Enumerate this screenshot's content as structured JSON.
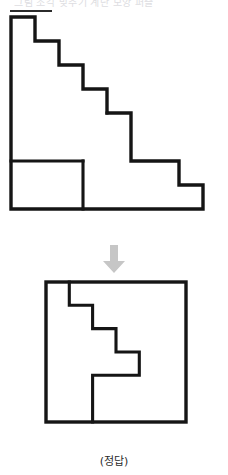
{
  "page": {
    "header_text": "그림 조각 맞추기 계단 모양 퍼즐",
    "caption": "(정답)",
    "background_color": "#ffffff",
    "ink_color": "#151515",
    "grid_color": "#9a9a9a",
    "arrow_color": "#c6c6c6"
  },
  "arrow": {
    "name": "down-arrow",
    "direction": "down",
    "glyph": "↓"
  },
  "figures": {
    "staircase": {
      "title": "staircase-polyomino",
      "cell_size": 24,
      "columns": 8,
      "rows": 8,
      "row_widths": [
        1,
        2,
        3,
        4,
        5,
        5,
        7,
        8
      ],
      "cut_lines": [
        {
          "name": "horizontal-cut",
          "row": 6,
          "from_col": 0,
          "to_col": 3
        },
        {
          "name": "vertical-cut",
          "col": 3,
          "from_row": 4,
          "to_row": 8
        }
      ]
    },
    "answer": {
      "title": "assembled-square",
      "cell_size": 24,
      "columns": 6,
      "rows": 6,
      "cut_path_points": [
        [
          1,
          0
        ],
        [
          1,
          1
        ],
        [
          2,
          1
        ],
        [
          2,
          2
        ],
        [
          3,
          2
        ],
        [
          3,
          3
        ],
        [
          4,
          3
        ],
        [
          4,
          4
        ],
        [
          2,
          4
        ],
        [
          2,
          6
        ]
      ]
    }
  }
}
